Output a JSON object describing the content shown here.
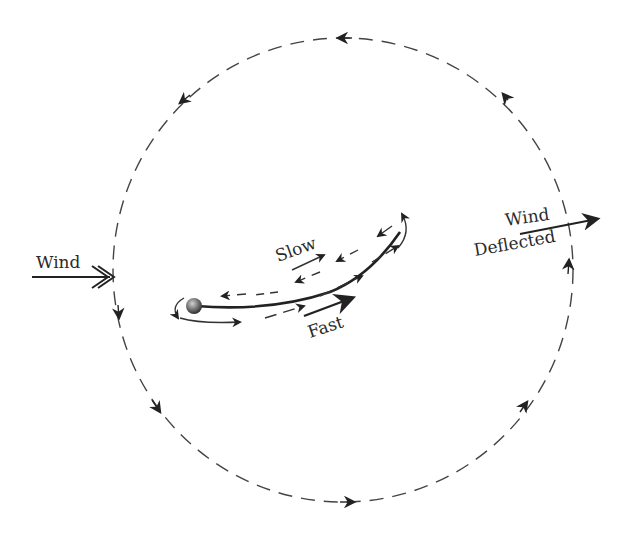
{
  "diagram": {
    "labels": {
      "wind_in": "Wind",
      "slow": "Slow",
      "fast": "Fast",
      "wind_out_1": "Wind",
      "wind_out_2": "Deflected"
    },
    "elements": {
      "circulation_loop": "dashed circular path with arrows (counter-clockwise on top, flowing down left side, along bottom, up right side)",
      "airfoil": "curved thin airfoil with rounded leading edge",
      "upper_flow": "dashed arrows along upper surface pointing back toward leading edge plus solid arrow forward (Slow)",
      "lower_flow": "dashed/solid arrows along lower surface pointing toward trailing edge (Fast)"
    },
    "colors": {
      "line": "#333333",
      "arrow": "#222222",
      "background": "#ffffff"
    }
  }
}
